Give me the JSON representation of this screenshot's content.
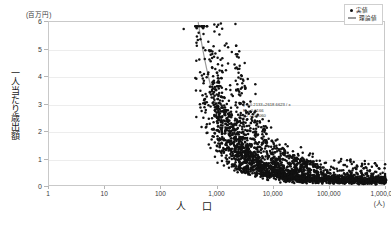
{
  "chart_data": {
    "type": "scatter",
    "title": "",
    "xlabel": "人　口",
    "xunit": "(人)",
    "ylabel": "一人当たり歳出額",
    "yunit": "(百万円)",
    "xscale": "log",
    "yscale": "linear",
    "xlim": [
      1,
      1000000
    ],
    "ylim": [
      0,
      6
    ],
    "grid": true,
    "legend_position": "top-right",
    "xticks": [
      "1",
      "10",
      "100",
      "1,000",
      "10,000",
      "100,000",
      "1,000,000"
    ],
    "xtick_values": [
      1,
      10,
      100,
      1000,
      10000,
      100000,
      1000000
    ],
    "yticks": [
      "0",
      "1",
      "2",
      "3",
      "4",
      "5",
      "6"
    ],
    "ytick_values": [
      0,
      1,
      2,
      3,
      4,
      5,
      6
    ],
    "series": [
      {
        "name": "実値",
        "type": "scatter",
        "marker": "dot",
        "color": "#111111",
        "points": [
          [
            250,
            5.75
          ],
          [
            600,
            3.2
          ],
          [
            600,
            3.02
          ],
          [
            900,
            3.0
          ],
          [
            420,
            2.55
          ],
          [
            560,
            2.52
          ],
          [
            700,
            2.48
          ],
          [
            1000,
            2.35
          ],
          [
            1400,
            2.3
          ],
          [
            520,
            2.18
          ],
          [
            800,
            2.1
          ],
          [
            1200,
            2.0
          ],
          [
            900,
            1.95
          ],
          [
            1600,
            1.9
          ],
          [
            1900,
            2.25
          ],
          [
            2300,
            2.15
          ],
          [
            2600,
            1.75
          ],
          [
            3100,
            1.62
          ],
          [
            700,
            1.55
          ],
          [
            1100,
            1.5
          ],
          [
            1500,
            1.42
          ],
          [
            2000,
            1.38
          ],
          [
            1000,
            1.3
          ],
          [
            1300,
            1.25
          ],
          [
            1700,
            1.2
          ],
          [
            2200,
            1.18
          ],
          [
            900,
            1.1
          ],
          [
            1400,
            1.06
          ],
          [
            1800,
            1.02
          ],
          [
            2400,
            1.0
          ],
          [
            1200,
            0.95
          ],
          [
            1600,
            0.92
          ],
          [
            2100,
            0.9
          ],
          [
            2800,
            0.88
          ],
          [
            1500,
            0.85
          ],
          [
            2000,
            0.82
          ],
          [
            2600,
            0.8
          ],
          [
            3400,
            0.78
          ],
          [
            1800,
            0.75
          ],
          [
            2400,
            0.73
          ],
          [
            3100,
            0.71
          ],
          [
            4000,
            0.7
          ],
          [
            2100,
            0.68
          ],
          [
            2800,
            0.66
          ],
          [
            3600,
            0.65
          ],
          [
            4600,
            0.63
          ],
          [
            2500,
            0.62
          ],
          [
            3300,
            0.6
          ],
          [
            4300,
            0.59
          ],
          [
            5500,
            0.58
          ],
          [
            3000,
            0.57
          ],
          [
            3900,
            0.56
          ],
          [
            5000,
            0.55
          ],
          [
            6500,
            0.54
          ],
          [
            3500,
            0.53
          ],
          [
            4600,
            0.52
          ],
          [
            6000,
            0.51
          ],
          [
            7800,
            0.5
          ],
          [
            4200,
            0.5
          ],
          [
            5500,
            0.49
          ],
          [
            7200,
            0.48
          ],
          [
            9300,
            0.47
          ],
          [
            5000,
            0.47
          ],
          [
            6500,
            0.46
          ],
          [
            8500,
            0.45
          ],
          [
            11000,
            0.45
          ],
          [
            6000,
            0.44
          ],
          [
            7800,
            0.44
          ],
          [
            10000,
            0.43
          ],
          [
            13000,
            0.43
          ],
          [
            7200,
            0.42
          ],
          [
            9300,
            0.42
          ],
          [
            12000,
            0.41
          ],
          [
            16000,
            0.41
          ],
          [
            8500,
            0.4
          ],
          [
            11000,
            0.4
          ],
          [
            14000,
            0.4
          ],
          [
            19000,
            0.39
          ],
          [
            10000,
            0.39
          ],
          [
            13000,
            0.38
          ],
          [
            17000,
            0.38
          ],
          [
            22000,
            0.38
          ],
          [
            12000,
            0.37
          ],
          [
            16000,
            0.37
          ],
          [
            20000,
            0.37
          ],
          [
            27000,
            0.36
          ],
          [
            15000,
            0.36
          ],
          [
            19000,
            0.36
          ],
          [
            25000,
            0.35
          ],
          [
            32000,
            0.35
          ],
          [
            18000,
            0.35
          ],
          [
            23000,
            0.35
          ],
          [
            30000,
            0.34
          ],
          [
            39000,
            0.34
          ],
          [
            22000,
            0.34
          ],
          [
            28000,
            0.34
          ],
          [
            36000,
            0.33
          ],
          [
            47000,
            0.33
          ],
          [
            26000,
            0.33
          ],
          [
            34000,
            0.33
          ],
          [
            44000,
            0.32
          ],
          [
            57000,
            0.32
          ],
          [
            32000,
            0.32
          ],
          [
            41000,
            0.32
          ],
          [
            53000,
            0.31
          ],
          [
            68000,
            0.31
          ],
          [
            38000,
            0.31
          ],
          [
            49000,
            0.31
          ],
          [
            64000,
            0.31
          ],
          [
            82000,
            0.3
          ],
          [
            46000,
            0.3
          ],
          [
            59000,
            0.3
          ],
          [
            77000,
            0.3
          ],
          [
            99000,
            0.3
          ],
          [
            56000,
            0.3
          ],
          [
            72000,
            0.29
          ],
          [
            93000,
            0.29
          ],
          [
            120000,
            0.29
          ],
          [
            68000,
            0.29
          ],
          [
            87000,
            0.29
          ],
          [
            112000,
            0.29
          ],
          [
            145000,
            0.29
          ],
          [
            82000,
            0.28
          ],
          [
            106000,
            0.28
          ],
          [
            136000,
            0.28
          ],
          [
            176000,
            0.28
          ],
          [
            100000,
            0.28
          ],
          [
            128000,
            0.28
          ],
          [
            165000,
            0.28
          ],
          [
            213000,
            0.28
          ],
          [
            120000,
            0.27
          ],
          [
            155000,
            0.27
          ],
          [
            200000,
            0.27
          ],
          [
            258000,
            0.27
          ],
          [
            146000,
            0.27
          ],
          [
            188000,
            0.27
          ],
          [
            242000,
            0.27
          ],
          [
            312000,
            0.27
          ],
          [
            177000,
            0.26
          ],
          [
            228000,
            0.26
          ],
          [
            293000,
            0.26
          ],
          [
            378000,
            0.26
          ],
          [
            214000,
            0.26
          ],
          [
            276000,
            0.26
          ],
          [
            355000,
            0.26
          ],
          [
            458000,
            0.26
          ],
          [
            260000,
            0.25
          ],
          [
            334000,
            0.25
          ],
          [
            430000,
            0.25
          ],
          [
            554000,
            0.25
          ],
          [
            315000,
            0.25
          ],
          [
            405000,
            0.25
          ],
          [
            521000,
            0.25
          ],
          [
            670000,
            0.25
          ],
          [
            382000,
            0.24
          ],
          [
            491000,
            0.24
          ],
          [
            631000,
            0.24
          ],
          [
            812000,
            0.24
          ],
          [
            463000,
            0.24
          ],
          [
            595000,
            0.24
          ],
          [
            765000,
            0.23
          ],
          [
            960000,
            0.23
          ],
          [
            3500,
            1.35
          ],
          [
            4500,
            1.15
          ],
          [
            5200,
            1.28
          ],
          [
            6300,
            1.05
          ],
          [
            4100,
            0.95
          ],
          [
            5800,
            0.88
          ],
          [
            7400,
            0.82
          ],
          [
            9000,
            0.76
          ],
          [
            2900,
            1.45
          ],
          [
            3800,
            1.3
          ],
          [
            2400,
            1.6
          ],
          [
            3200,
            1.5
          ],
          [
            12000,
            0.72
          ],
          [
            15000,
            0.68
          ],
          [
            18000,
            0.62
          ],
          [
            25000,
            0.58
          ],
          [
            9500,
            0.9
          ],
          [
            11500,
            0.85
          ],
          [
            14000,
            0.8
          ],
          [
            21000,
            0.66
          ],
          [
            32000,
            0.55
          ],
          [
            45000,
            0.52
          ],
          [
            60000,
            0.48
          ],
          [
            85000,
            0.44
          ],
          [
            40000,
            0.6
          ],
          [
            55000,
            0.56
          ],
          [
            75000,
            0.5
          ],
          [
            110000,
            0.42
          ],
          [
            150000,
            0.4
          ],
          [
            210000,
            0.38
          ],
          [
            300000,
            0.36
          ],
          [
            420000,
            0.34
          ],
          [
            180000,
            0.34
          ],
          [
            250000,
            0.32
          ],
          [
            350000,
            0.3
          ],
          [
            500000,
            0.29
          ],
          [
            1000,
            1.85
          ],
          [
            1300,
            1.7
          ],
          [
            1700,
            1.58
          ],
          [
            2100,
            1.48
          ],
          [
            750,
            1.42
          ],
          [
            950,
            1.33
          ],
          [
            1150,
            1.27
          ],
          [
            1450,
            1.15
          ],
          [
            2600,
            1.22
          ],
          [
            3300,
            1.12
          ],
          [
            4200,
            1.0
          ],
          [
            5400,
            0.93
          ],
          [
            6800,
            0.86
          ],
          [
            8700,
            0.79
          ],
          [
            11000,
            0.73
          ],
          [
            14500,
            0.67
          ],
          [
            1800,
            2.6
          ],
          [
            2500,
            2.4
          ],
          [
            3400,
            2.05
          ],
          [
            4600,
            1.72
          ],
          [
            1200,
            2.75
          ],
          [
            1600,
            2.62
          ],
          [
            2200,
            2.45
          ],
          [
            3000,
            2.2
          ],
          [
            900,
            2.9
          ],
          [
            1100,
            2.68
          ],
          [
            1450,
            2.5
          ],
          [
            2000,
            2.28
          ],
          [
            5800,
            1.45
          ],
          [
            7500,
            1.3
          ],
          [
            9800,
            1.18
          ],
          [
            13000,
            1.05
          ],
          [
            17000,
            0.95
          ],
          [
            23000,
            0.85
          ],
          [
            30000,
            0.75
          ],
          [
            40000,
            0.68
          ],
          [
            52000,
            0.62
          ],
          [
            70000,
            0.56
          ],
          [
            92000,
            0.5
          ],
          [
            125000,
            0.45
          ],
          [
            165000,
            0.42
          ],
          [
            220000,
            0.38
          ],
          [
            290000,
            0.35
          ],
          [
            390000,
            0.32
          ],
          [
            650000,
            0.3
          ],
          [
            850000,
            0.28
          ],
          [
            720000,
            0.26
          ],
          [
            1000000,
            0.25
          ],
          [
            3800,
            0.45
          ],
          [
            5000,
            0.42
          ],
          [
            6600,
            0.4
          ],
          [
            8800,
            0.38
          ],
          [
            11500,
            0.36
          ],
          [
            15500,
            0.34
          ],
          [
            20500,
            0.33
          ],
          [
            27000,
            0.32
          ],
          [
            36000,
            0.31
          ],
          [
            48000,
            0.3
          ],
          [
            64000,
            0.29
          ],
          [
            86000,
            0.28
          ],
          [
            115000,
            0.27
          ],
          [
            155000,
            0.26
          ],
          [
            205000,
            0.25
          ],
          [
            275000,
            0.24
          ],
          [
            370000,
            0.23
          ],
          [
            490000,
            0.23
          ],
          [
            660000,
            0.22
          ],
          [
            890000,
            0.22
          ],
          [
            2000,
            0.6
          ],
          [
            2700,
            0.55
          ],
          [
            3600,
            0.5
          ],
          [
            4800,
            0.46
          ],
          [
            1600,
            0.7
          ],
          [
            2200,
            0.64
          ],
          [
            1300,
            0.78
          ],
          [
            1000,
            0.88
          ]
        ]
      },
      {
        "name": "理論値",
        "type": "line",
        "color": "#9a9a9a",
        "formula": "y = 0.2133 + 2618.6623 / x"
      }
    ],
    "annotations": {
      "equation": "y = 0.2133+2618.6623 / x",
      "correlation": "R = 0.6166",
      "r_squared": "R2 = 0.6060"
    }
  },
  "legend": {
    "items": [
      {
        "label": "実値",
        "marker": "dot"
      },
      {
        "label": "理論値",
        "marker": "line"
      }
    ]
  }
}
